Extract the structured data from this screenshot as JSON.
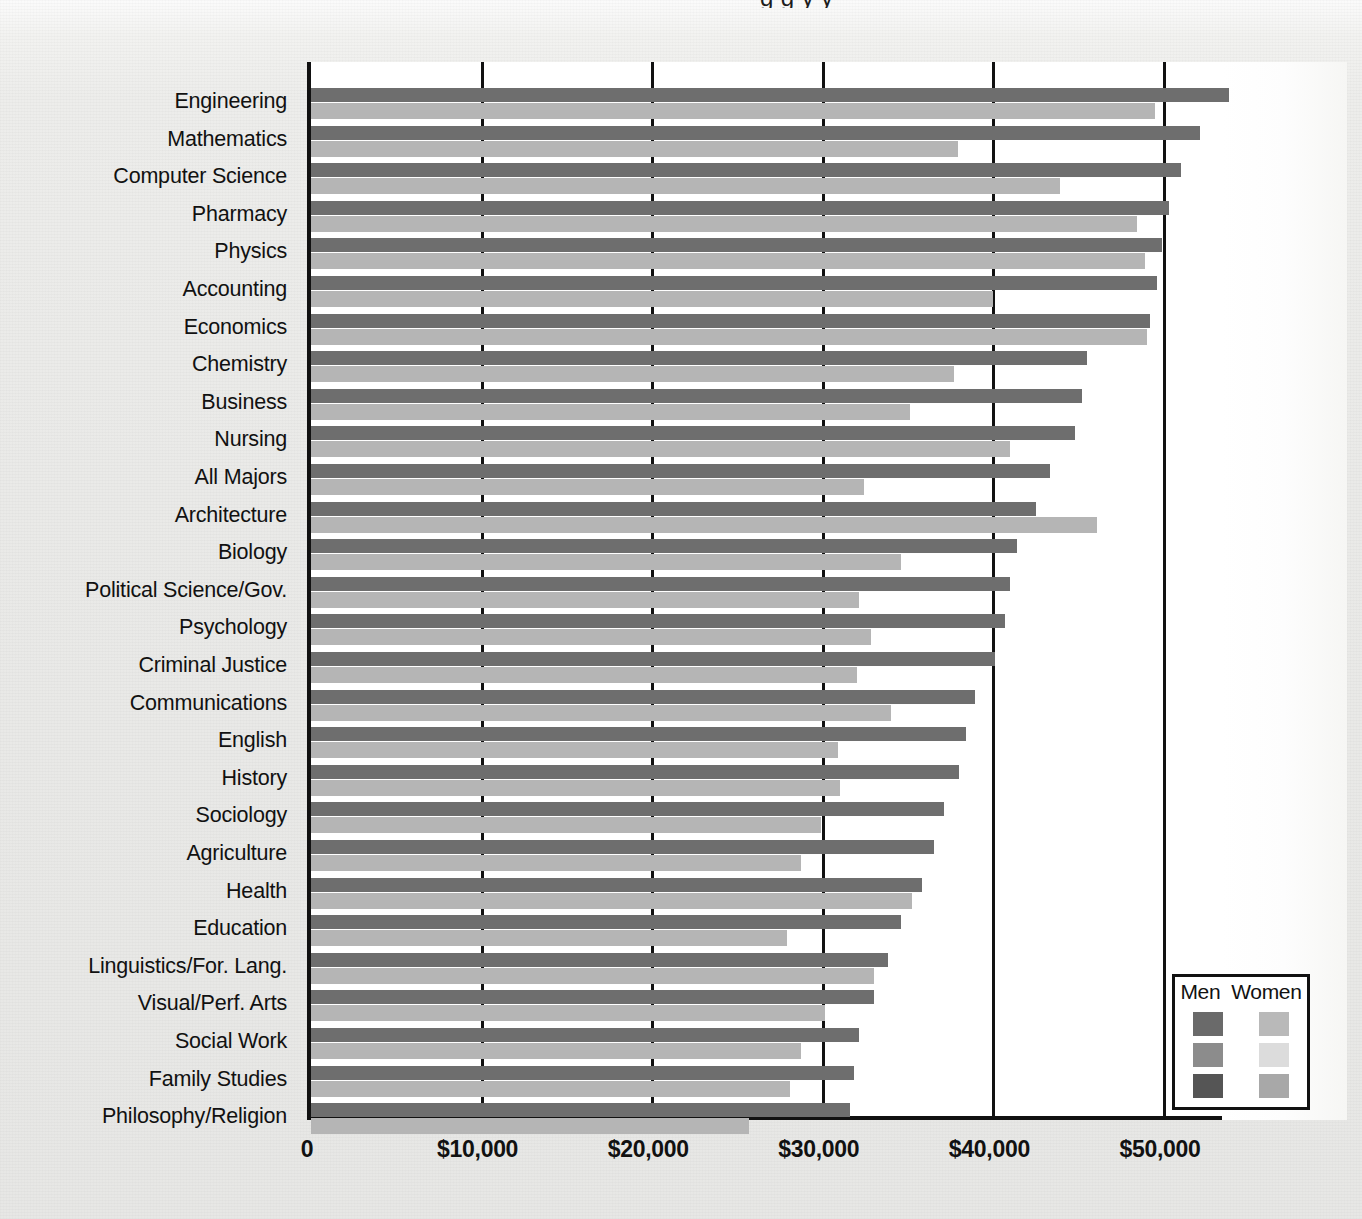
{
  "title_sliver": "g      g      y   y",
  "chart_data": {
    "type": "bar",
    "orientation": "horizontal",
    "title": "",
    "xlabel": "",
    "ylabel": "",
    "xlim": [
      0,
      53600
    ],
    "xticks": [
      0,
      10000,
      20000,
      30000,
      40000,
      50000
    ],
    "xtick_labels": [
      "0",
      "$10,000",
      "$20,000",
      "$30,000",
      "$40,000",
      "$50,000"
    ],
    "grid": true,
    "legend_position": "bottom-right",
    "categories": [
      "Engineering",
      "Mathematics",
      "Computer Science",
      "Pharmacy",
      "Physics",
      "Accounting",
      "Economics",
      "Chemistry",
      "Business",
      "Nursing",
      "All Majors",
      "Architecture",
      "Biology",
      "Political Science/Gov.",
      "Psychology",
      "Criminal Justice",
      "Communications",
      "English",
      "History",
      "Sociology",
      "Agriculture",
      "Health",
      "Education",
      "Linguistics/For. Lang.",
      "Visual/Perf. Arts",
      "Social Work",
      "Family Studies",
      "Philosophy/Religion"
    ],
    "series": [
      {
        "name": "Men",
        "color": "#6e6e6e",
        "values": [
          53800,
          52100,
          51000,
          50300,
          49900,
          49600,
          49200,
          45500,
          45200,
          44800,
          43300,
          42500,
          41400,
          41000,
          40700,
          40100,
          38900,
          38400,
          38000,
          37100,
          36500,
          35800,
          34600,
          33800,
          33000,
          32100,
          31800,
          31600
        ]
      },
      {
        "name": "Women",
        "color": "#b5b5b5",
        "values": [
          49500,
          37900,
          43900,
          48400,
          48900,
          40000,
          49000,
          37700,
          35100,
          41000,
          32400,
          46100,
          34600,
          32100,
          32800,
          32000,
          34000,
          30900,
          31000,
          29900,
          28700,
          35200,
          27900,
          33000,
          30100,
          28700,
          28100,
          25700
        ]
      }
    ]
  },
  "legend": {
    "men_label": "Men",
    "women_label": "Women",
    "men_swatches": [
      "#6a6a6a",
      "#8c8c8c",
      "#555555"
    ],
    "women_swatches": [
      "#b9b9b9",
      "#dcdcdc",
      "#a8a8a8"
    ]
  }
}
